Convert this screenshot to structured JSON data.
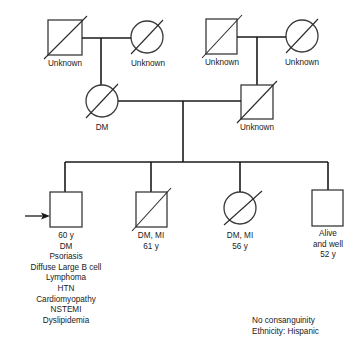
{
  "diagram": {
    "type": "pedigree",
    "colors": {
      "line": "#1a1a1a",
      "shape_stroke": "#3a3a3a",
      "background": "#ffffff"
    },
    "generation1": {
      "paternal_grandfather": {
        "sex": "male",
        "deceased": true,
        "label": "Unknown"
      },
      "paternal_grandmother": {
        "sex": "female",
        "deceased": true,
        "label": "Unknown"
      },
      "maternal_grandfather": {
        "sex": "male",
        "deceased": true,
        "label": "Unknown"
      },
      "maternal_grandmother": {
        "sex": "female",
        "deceased": true,
        "label": "Unknown"
      }
    },
    "generation2": {
      "mother": {
        "sex": "female",
        "deceased": true,
        "label": "DM"
      },
      "father": {
        "sex": "male",
        "deceased": true,
        "label": "Unknown"
      }
    },
    "generation3": {
      "proband": {
        "sex": "male",
        "deceased": false,
        "is_proband": true,
        "lines": [
          "60 y",
          "DM",
          "Psoriasis",
          "Diffuse Large B cell",
          "Lymphoma",
          "HTN",
          "Cardiomyopathy",
          "NSTEMI",
          "Dyslipidemia"
        ]
      },
      "brother1": {
        "sex": "male",
        "deceased": true,
        "lines": [
          "DM, MI",
          "61 y"
        ]
      },
      "sister": {
        "sex": "female",
        "deceased": true,
        "lines": [
          "DM, MI",
          "56 y"
        ]
      },
      "brother2": {
        "sex": "male",
        "deceased": false,
        "lines": [
          "Alive",
          "and well",
          "52 y"
        ]
      }
    },
    "notes": [
      "No consanguinity",
      "Ethnicity: Hispanic"
    ]
  }
}
